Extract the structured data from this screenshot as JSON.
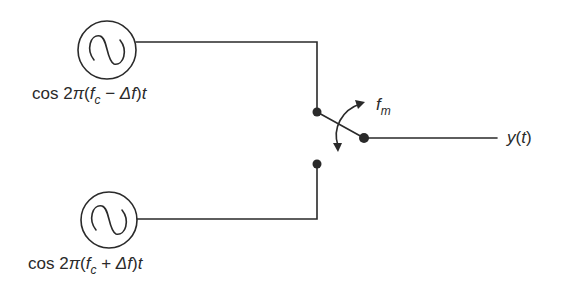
{
  "diagram": {
    "type": "FSK modulator (switched oscillators)",
    "colors": {
      "stroke": "#2a2a2a",
      "background": "#ffffff"
    },
    "oscillators": [
      {
        "id": "osc-top",
        "icon": "sine-wave-source-icon",
        "label": {
          "prefix": "cos 2",
          "pi": "π",
          "open": "(",
          "f": "f",
          "sub": "c",
          "op": " − ",
          "delta": "Δ",
          "f2": "f",
          "close": ")",
          "t": "t"
        },
        "label_text": "cos 2π(f_c − Δf)t"
      },
      {
        "id": "osc-bottom",
        "icon": "sine-wave-source-icon",
        "label": {
          "prefix": "cos 2",
          "pi": "π",
          "open": "(",
          "f": "f",
          "sub": "c",
          "op": " + ",
          "delta": "Δ",
          "f2": "f",
          "close": ")",
          "t": "t"
        },
        "label_text": "cos 2π(f_c + Δf)t"
      }
    ],
    "switch": {
      "rate_label": {
        "f": "f",
        "sub": "m"
      },
      "rate_label_text": "f_m"
    },
    "output": {
      "label": {
        "y": "y",
        "open": "(",
        "t": "t",
        "close": ")"
      },
      "label_text": "y(t)"
    }
  }
}
